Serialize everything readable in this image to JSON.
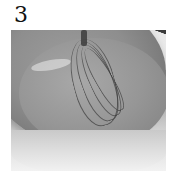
{
  "step": {
    "number": "3"
  },
  "photo": {
    "subject": "metal mixing bowl with wire whisk",
    "color_mode": "grayscale",
    "colors": {
      "bowl_dark": "#7b7b7b",
      "bowl_mid": "#969696",
      "rim_light": "#d9d9d9",
      "background": "#ffffff",
      "whisk": "#3c3c3c"
    }
  }
}
